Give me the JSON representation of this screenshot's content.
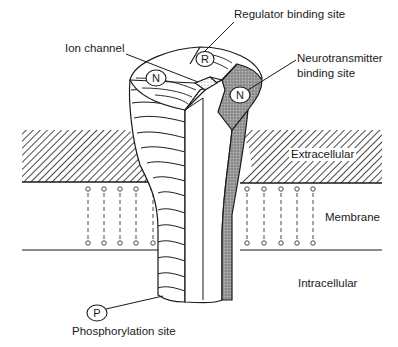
{
  "labels": {
    "regulator": "Regulator binding site",
    "ion_channel": "Ion channel",
    "neurotransmitter_line1": "Neurotransmitter",
    "neurotransmitter_line2": "binding site",
    "extracellular": "Extracellular",
    "membrane": "Membrane",
    "intracellular": "Intracellular",
    "phosphorylation": "Phosphorylation site"
  },
  "markers": {
    "regulator": "R",
    "neurotransmitter_left": "N",
    "neurotransmitter_right": "N",
    "phosphorylation": "P"
  },
  "colors": {
    "line": "#1a1a1a",
    "shade_dark": "#8a8a8a",
    "shade_light": "#cfcfcf",
    "background": "#ffffff"
  }
}
